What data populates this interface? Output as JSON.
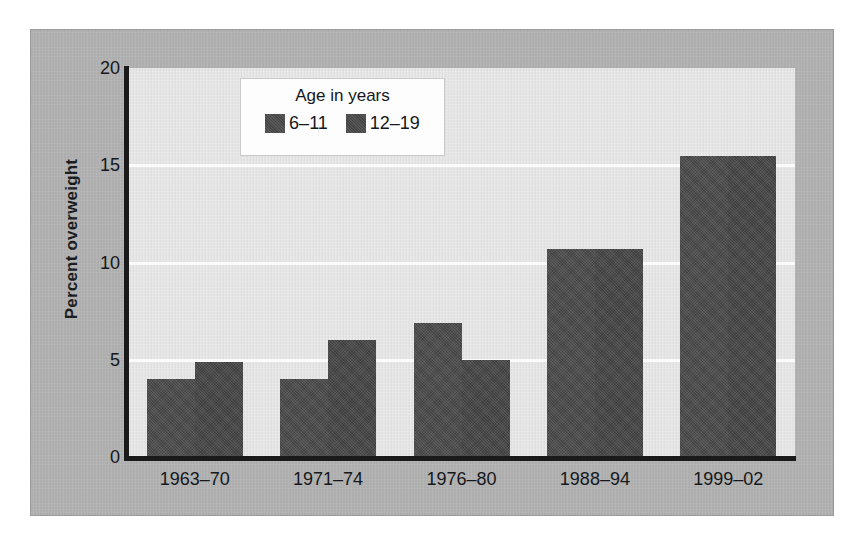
{
  "chart_data": {
    "type": "bar",
    "title": "",
    "subtitle": "",
    "xlabel": "",
    "ylabel": "Percent overweight",
    "categories": [
      "1963–70",
      "1971–74",
      "1976–80",
      "1988–94",
      "1999–02"
    ],
    "series": [
      {
        "name": "6–11",
        "values": [
          4.0,
          4.0,
          6.9,
          10.7,
          15.5
        ],
        "color": "#4c4c4c"
      },
      {
        "name": "12–19",
        "values": [
          4.9,
          6.0,
          5.0,
          10.7,
          15.5
        ],
        "color": "#474747"
      }
    ],
    "ylim": [
      0,
      20
    ],
    "yticks": [
      0,
      5,
      10,
      15,
      20
    ],
    "ytick_labels": [
      "0",
      "5",
      "10",
      "15",
      "20"
    ],
    "grid": true,
    "grid_axis": "y",
    "legend_position": "upper-left-inside",
    "legend_title": "Age in years",
    "plot_background": "#e9e9e9",
    "panel_background": "#b3b3b3",
    "axis_color": "#1a1a1a",
    "gridline_color": "#fbfbfb"
  },
  "legend": {
    "title": "Age in years",
    "entries": [
      {
        "label": "6–11"
      },
      {
        "label": "12–19"
      }
    ]
  },
  "axes": {
    "y_title": "Percent overweight",
    "y_ticks": [
      "0",
      "5",
      "10",
      "15",
      "20"
    ],
    "x_ticks": [
      "1963–70",
      "1971–74",
      "1976–80",
      "1988–94",
      "1999–02"
    ]
  }
}
